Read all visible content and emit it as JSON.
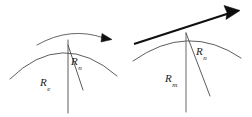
{
  "figure": {
    "background_color": "#ffffff",
    "stroke_color": "#3c3c3c",
    "thick_stroke_color": "#0d0d0d",
    "label_color": "#1a1a1a",
    "width": 252,
    "height": 117
  },
  "panels": [
    {
      "id": "left-panel",
      "name": "left-diagram",
      "labels": {
        "outer_radius": {
          "symbol": "R",
          "subscript": "e",
          "text": "Re"
        },
        "inner_radius": {
          "symbol": "R",
          "subscript": "n",
          "text": "Rn"
        }
      },
      "arrow": {
        "style": "thin-curved",
        "direction": "right",
        "head": "filled-triangle"
      },
      "arcs": 2,
      "radius_lines": 2
    },
    {
      "id": "right-panel",
      "name": "right-diagram",
      "labels": {
        "outer_radius": {
          "symbol": "R",
          "subscript": "m",
          "text": "Rm"
        },
        "inner_radius": {
          "symbol": "R",
          "subscript": "n",
          "text": "Rn"
        }
      },
      "arrow": {
        "style": "thick-straight",
        "direction": "up-right",
        "head": "filled-triangle"
      },
      "arcs": 1,
      "radius_lines": 2
    }
  ]
}
